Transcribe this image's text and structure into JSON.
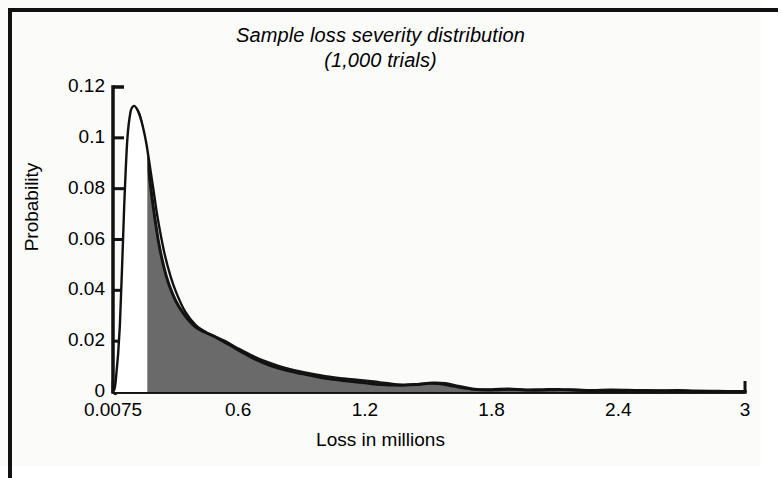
{
  "figure": {
    "title_line_1": "Sample loss severity distribution",
    "title_line_2": "(1,000 trials)",
    "frame_color": "#111111",
    "background_color": "#fbfbfa"
  },
  "chart_data": {
    "type": "area",
    "title": "Sample loss severity distribution (1,000 trials)",
    "subtitle": "(1,000 trials)",
    "xlabel": "Loss in millions",
    "ylabel": "Probability",
    "xlim": [
      0.0075,
      3
    ],
    "ylim": [
      0,
      0.12
    ],
    "grid": false,
    "legend": "none",
    "xticks": [
      0.0075,
      0.6,
      1.2,
      1.8,
      2.4,
      3
    ],
    "xtick_labels": [
      "0.0075",
      "0.6",
      "1.2",
      "1.8",
      "2.4",
      "3"
    ],
    "yticks": [
      0,
      0.02,
      0.04,
      0.06,
      0.08,
      0.1,
      0.12
    ],
    "ytick_labels": [
      "0",
      "0.02",
      "0.04",
      "0.06",
      "0.08",
      "0.1",
      "0.12"
    ],
    "series": [
      {
        "name": "fitted distribution outline",
        "style": "line",
        "color": "#111111",
        "fill": "none",
        "x": [
          0.0075,
          0.02,
          0.04,
          0.06,
          0.075,
          0.09,
          0.105,
          0.12,
          0.135,
          0.15,
          0.165,
          0.18,
          0.2,
          0.22,
          0.25,
          0.28,
          0.31,
          0.35,
          0.4,
          0.45,
          0.5,
          0.56,
          0.62,
          0.68,
          0.75,
          0.82,
          0.9,
          0.98,
          1.05,
          1.12,
          1.2,
          1.28,
          1.36,
          1.44,
          1.5,
          1.56,
          1.62,
          1.7,
          1.8,
          1.9,
          2.0,
          2.1,
          2.2,
          2.3,
          2.4,
          2.5,
          2.6,
          2.7,
          2.8,
          2.9,
          3.0
        ],
        "y": [
          0.0,
          0.004,
          0.026,
          0.072,
          0.099,
          0.11,
          0.1125,
          0.1115,
          0.1085,
          0.104,
          0.098,
          0.09,
          0.079,
          0.068,
          0.055,
          0.0455,
          0.0385,
          0.0315,
          0.0262,
          0.0234,
          0.0212,
          0.0184,
          0.0155,
          0.0128,
          0.0104,
          0.0086,
          0.0071,
          0.0058,
          0.0049,
          0.0042,
          0.0035,
          0.0028,
          0.0026,
          0.003,
          0.0034,
          0.0031,
          0.0022,
          0.0012,
          0.0008,
          0.001,
          0.0007,
          0.0008,
          0.0009,
          0.0006,
          0.0005,
          0.0007,
          0.0006,
          0.0004,
          0.0003,
          0.0002,
          0.0002
        ]
      },
      {
        "name": "sampled loss severity histogram",
        "style": "filled-area",
        "color": "#6a6a6a",
        "edge_color": "#141414",
        "x": [
          0.0075,
          0.03,
          0.055,
          0.075,
          0.095,
          0.112,
          0.13,
          0.145,
          0.16,
          0.175,
          0.19,
          0.21,
          0.23,
          0.26,
          0.29,
          0.32,
          0.36,
          0.4,
          0.44,
          0.49,
          0.54,
          0.6,
          0.66,
          0.72,
          0.79,
          0.86,
          0.94,
          1.02,
          1.1,
          1.17,
          1.24,
          1.31,
          1.38,
          1.45,
          1.52,
          1.58,
          1.64,
          1.72,
          1.8,
          1.88,
          1.96,
          2.04,
          2.12,
          2.2,
          2.28,
          2.36,
          2.44,
          2.52,
          2.6,
          2.68,
          2.76,
          2.84,
          2.92,
          3.0
        ],
        "y": [
          0.0,
          0.002,
          0.028,
          0.07,
          0.101,
          0.1105,
          0.1095,
          0.1045,
          0.097,
          0.088,
          0.078,
          0.066,
          0.056,
          0.0455,
          0.0385,
          0.0335,
          0.0288,
          0.0254,
          0.0236,
          0.0218,
          0.0198,
          0.017,
          0.0144,
          0.0122,
          0.0102,
          0.0086,
          0.0072,
          0.006,
          0.0052,
          0.0046,
          0.004,
          0.0033,
          0.0028,
          0.003,
          0.0035,
          0.0033,
          0.0023,
          0.0011,
          0.0009,
          0.0012,
          0.0008,
          0.0009,
          0.001,
          0.0007,
          0.0006,
          0.0008,
          0.0007,
          0.0005,
          0.0004,
          0.0006,
          0.0004,
          0.0003,
          0.0002,
          0.0002
        ]
      }
    ]
  }
}
